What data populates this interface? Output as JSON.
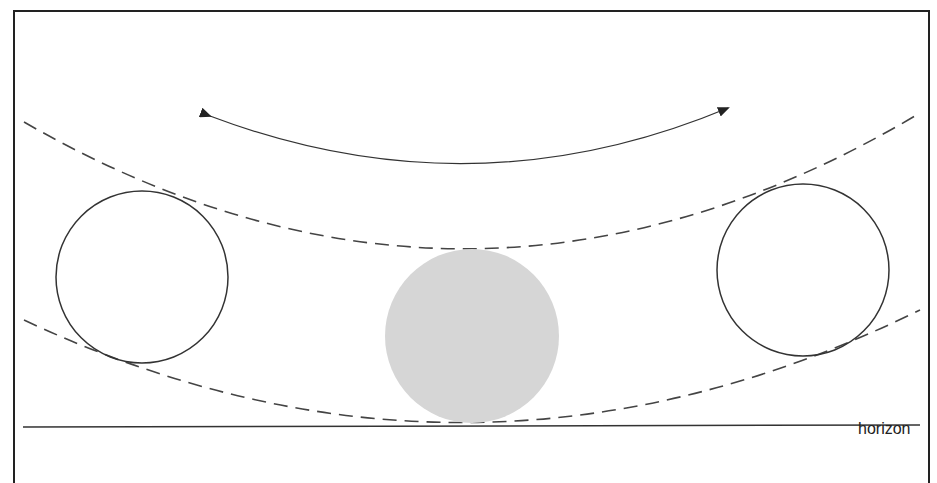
{
  "diagram": {
    "horizon_label": "horizon",
    "colors": {
      "line": "#2a2a2a",
      "dashed": "#444444",
      "sphere_fill": "#d6d6d6",
      "background": "#ffffff"
    },
    "elements": [
      {
        "id": "left-circle",
        "type": "circle-outline"
      },
      {
        "id": "center-circle",
        "type": "circle-filled-gray"
      },
      {
        "id": "right-circle",
        "type": "circle-outline"
      },
      {
        "id": "upper-dashed-arc",
        "type": "dashed-curve"
      },
      {
        "id": "lower-dashed-arc",
        "type": "dashed-curve"
      },
      {
        "id": "double-headed-arrow",
        "type": "curved-arrow"
      },
      {
        "id": "horizon-line",
        "type": "line"
      }
    ]
  }
}
